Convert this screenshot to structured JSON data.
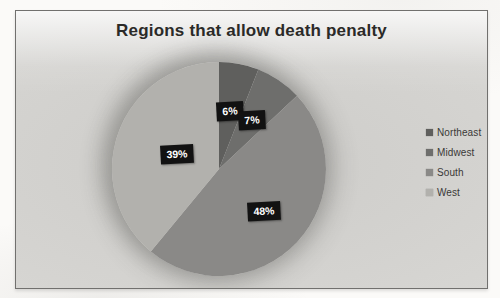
{
  "chart": {
    "title": "Regions that allow death penalty"
  },
  "chart_data": {
    "type": "pie",
    "title": "Regions that allow death penalty",
    "categories": [
      "Northeast",
      "Midwest",
      "South",
      "West"
    ],
    "values": [
      6,
      7,
      48,
      39
    ],
    "labels": [
      "6%",
      "7%",
      "48%",
      "39%"
    ],
    "colors": [
      "#5f5f5d",
      "#6e6e6c",
      "#8a8987",
      "#b2b1ad"
    ],
    "label_bg": "#121212",
    "label_text_color": "#ffffff",
    "legend_position": "right",
    "start_angle_deg": 0,
    "direction": "clockwise",
    "grid": false
  }
}
